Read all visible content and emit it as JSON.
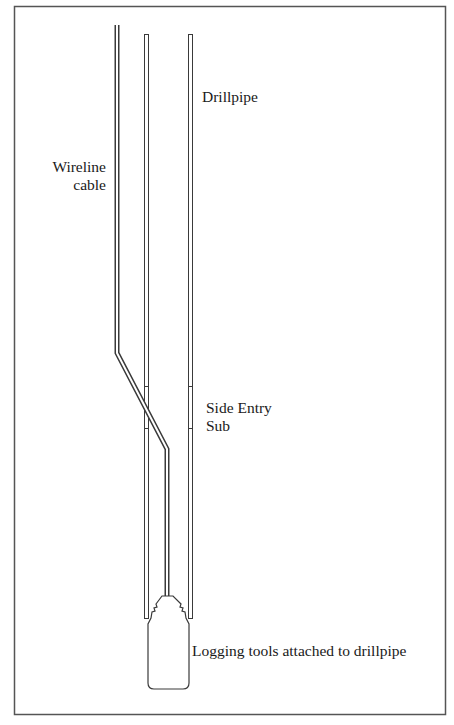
{
  "figure": {
    "type": "schematic",
    "colors": {
      "line": "#3a3a3a",
      "frame": "#555555",
      "background": "#ffffff",
      "text": "#1a1a1a"
    }
  },
  "labels": {
    "drillpipe": "Drillpipe",
    "wireline_line1": "Wireline",
    "wireline_line2": "cable",
    "side_entry_line1": "Side Entry",
    "side_entry_line2": "Sub",
    "logging_tools": "Logging tools attached to drillpipe"
  },
  "components": [
    {
      "id": "drillpipe",
      "label_ref": "labels.drillpipe"
    },
    {
      "id": "wireline-cable",
      "label_ref": "labels.wireline_line1"
    },
    {
      "id": "side-entry-sub",
      "label_ref": "labels.side_entry_line1"
    },
    {
      "id": "logging-tools",
      "label_ref": "labels.logging_tools"
    }
  ]
}
